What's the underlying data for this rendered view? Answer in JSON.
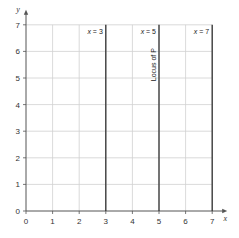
{
  "chart_data": {
    "type": "line",
    "title": "",
    "xlabel": "x",
    "ylabel": "y",
    "xlim": [
      0,
      7
    ],
    "ylim": [
      0,
      7
    ],
    "x_ticks": [
      0,
      1,
      2,
      3,
      4,
      5,
      6,
      7
    ],
    "y_ticks": [
      0,
      1,
      2,
      3,
      4,
      5,
      6,
      7
    ],
    "grid": true,
    "series": [
      {
        "name": "x = 3",
        "type": "vertical",
        "x": 3,
        "y_range": [
          0,
          7
        ]
      },
      {
        "name": "x = 5",
        "type": "vertical",
        "x": 5,
        "y_range": [
          0,
          7
        ]
      },
      {
        "name": "x = 7",
        "type": "vertical",
        "x": 7,
        "y_range": [
          0,
          7
        ]
      }
    ],
    "annotations": [
      {
        "text": "x = 3",
        "x": 3,
        "y": 7,
        "position": "top-left of line"
      },
      {
        "text": "x = 5",
        "x": 5,
        "y": 7,
        "position": "top-left of line"
      },
      {
        "text": "x = 7",
        "x": 7,
        "y": 7,
        "position": "top-left of line"
      },
      {
        "text": "Locus of P",
        "x": 5,
        "y": 5.5,
        "rotation": -90,
        "attached_to": "x = 5"
      }
    ]
  },
  "labels": {
    "x_axis": "x",
    "y_axis": "y",
    "line_x3": "x = 3",
    "line_x5": "x = 5",
    "line_x7": "x = 7",
    "locus": "Locus of P"
  },
  "colors": {
    "grid": "#d0d0d0",
    "axis": "#555555",
    "line": "#333333",
    "text": "#333333"
  }
}
